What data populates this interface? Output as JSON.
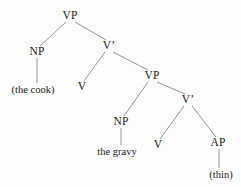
{
  "figure": {
    "type": "syntax-tree",
    "background_color": "#fdfdfd",
    "line_color": "#8a8a8a",
    "text_color": "#1b1b1b"
  },
  "nodes": [
    {
      "id": "vp1",
      "label": "VP",
      "kind": "category",
      "x": 70,
      "y": 16
    },
    {
      "id": "np1",
      "label": "NP",
      "kind": "category",
      "x": 37,
      "y": 52
    },
    {
      "id": "thecook",
      "label": "(the cook)",
      "kind": "leaf",
      "x": 33,
      "y": 90
    },
    {
      "id": "vbar1",
      "label": "V’",
      "kind": "category",
      "x": 109,
      "y": 46
    },
    {
      "id": "v1",
      "label": "V",
      "kind": "category",
      "x": 82,
      "y": 87
    },
    {
      "id": "vp2",
      "label": "VP",
      "kind": "category",
      "x": 152,
      "y": 76
    },
    {
      "id": "np2",
      "label": "NP",
      "kind": "category",
      "x": 121,
      "y": 122
    },
    {
      "id": "thegravy",
      "label": "the gravy",
      "kind": "leaf",
      "x": 117,
      "y": 152
    },
    {
      "id": "vbar2",
      "label": "V’",
      "kind": "category",
      "x": 188,
      "y": 100
    },
    {
      "id": "v2",
      "label": "V",
      "kind": "category",
      "x": 158,
      "y": 145
    },
    {
      "id": "ap",
      "label": "AP",
      "kind": "category",
      "x": 218,
      "y": 143
    },
    {
      "id": "thin",
      "label": "(thin)",
      "kind": "leaf",
      "x": 221,
      "y": 175
    }
  ],
  "edges": [
    {
      "from": "vp1",
      "to": "np1",
      "x1": 66,
      "y1": 22,
      "x2": 40,
      "y2": 46
    },
    {
      "from": "vp1",
      "to": "vbar1",
      "x1": 75,
      "y1": 22,
      "x2": 106,
      "y2": 40
    },
    {
      "from": "np1",
      "to": "thecook",
      "x1": 37,
      "y1": 58,
      "x2": 37,
      "y2": 83
    },
    {
      "from": "vbar1",
      "to": "v1",
      "x1": 105,
      "y1": 52,
      "x2": 84,
      "y2": 81
    },
    {
      "from": "vbar1",
      "to": "vp2",
      "x1": 113,
      "y1": 52,
      "x2": 148,
      "y2": 70
    },
    {
      "from": "vp2",
      "to": "np2",
      "x1": 148,
      "y1": 82,
      "x2": 124,
      "y2": 116
    },
    {
      "from": "vp2",
      "to": "vbar2",
      "x1": 157,
      "y1": 82,
      "x2": 185,
      "y2": 94
    },
    {
      "from": "np2",
      "to": "thegravy",
      "x1": 121,
      "y1": 128,
      "x2": 121,
      "y2": 145
    },
    {
      "from": "vbar2",
      "to": "v2",
      "x1": 184,
      "y1": 106,
      "x2": 160,
      "y2": 139
    },
    {
      "from": "vbar2",
      "to": "ap",
      "x1": 192,
      "y1": 106,
      "x2": 216,
      "y2": 137
    },
    {
      "from": "ap",
      "to": "thin",
      "x1": 219,
      "y1": 149,
      "x2": 219,
      "y2": 168
    }
  ]
}
